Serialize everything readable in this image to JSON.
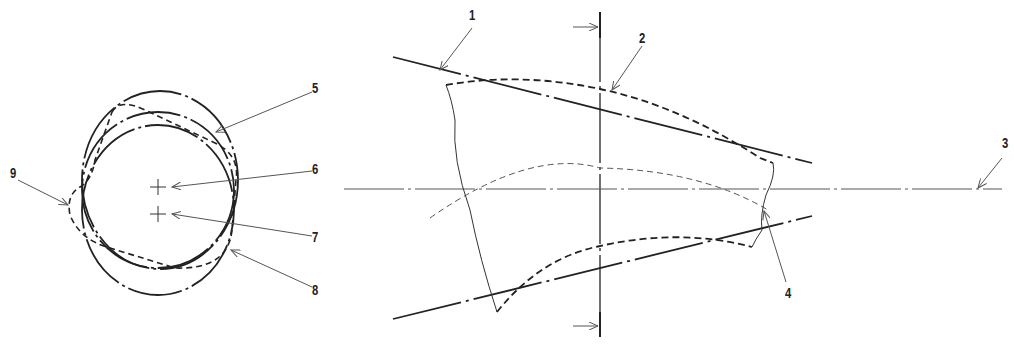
{
  "figure": {
    "left_view": {
      "labels": [
        {
          "id": "5",
          "text": "5",
          "x": 312,
          "y": 79
        },
        {
          "id": "6",
          "text": "6",
          "x": 312,
          "y": 160
        },
        {
          "id": "7",
          "text": "7",
          "x": 312,
          "y": 228
        },
        {
          "id": "8",
          "text": "8",
          "x": 312,
          "y": 281
        },
        {
          "id": "9",
          "text": "9",
          "x": 10,
          "y": 164
        }
      ],
      "centers": [
        {
          "name": "center-6",
          "x": 158,
          "y": 187
        },
        {
          "name": "center-7",
          "x": 158,
          "y": 214
        }
      ]
    },
    "right_view": {
      "labels": [
        {
          "id": "1",
          "text": "1",
          "x": 469,
          "y": 6
        },
        {
          "id": "2",
          "text": "2",
          "x": 639,
          "y": 29
        },
        {
          "id": "3",
          "text": "3",
          "x": 1002,
          "y": 134
        },
        {
          "id": "4",
          "text": "4",
          "x": 785,
          "y": 284
        }
      ],
      "section_line_x": 600,
      "centerline_y": 189
    },
    "colors": {
      "line": "#222222",
      "thin_line": "#555555"
    }
  }
}
